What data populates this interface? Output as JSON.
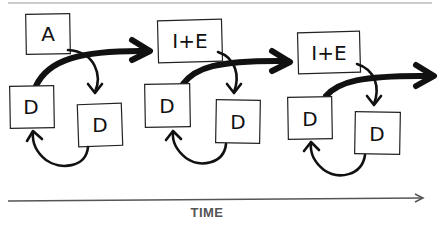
{
  "diagram": {
    "axis_label": "TIME",
    "stages": [
      {
        "top_box": "A",
        "left_box": "D",
        "right_box": "D"
      },
      {
        "top_box": "I+E",
        "left_box": "D",
        "right_box": "D"
      },
      {
        "top_box": "I+E",
        "left_box": "D",
        "right_box": "D"
      }
    ],
    "colors": {
      "stroke": "#111111",
      "axis": "#555555",
      "background": "#ffffff"
    }
  }
}
